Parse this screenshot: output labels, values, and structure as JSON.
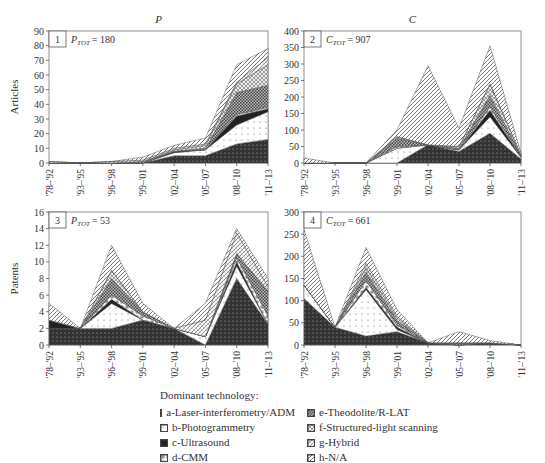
{
  "chart_data": [
    {
      "type": "area",
      "stacked": true,
      "panel_number": "1",
      "title": "P",
      "annotation": "P_TOT = 180",
      "annotation_main": "P",
      "annotation_sub": "TOT",
      "annotation_value": "= 180",
      "xlabel": "",
      "ylabel": "Articles",
      "ylim": [
        0,
        90
      ],
      "yticks": [
        0,
        10,
        20,
        30,
        40,
        50,
        60,
        70,
        80,
        90
      ],
      "categories": [
        "'78–'92",
        "'93–'95",
        "'96–'98",
        "'99–'01",
        "'02–'04",
        "'05–'07",
        "'08–'10",
        "'11–'13"
      ],
      "series": [
        {
          "name": "a-Laser-interferometry/ADM",
          "values": [
            0,
            0,
            0,
            0,
            5,
            5,
            13,
            16
          ]
        },
        {
          "name": "b-Photogrammetry",
          "values": [
            0,
            0,
            0,
            0,
            2,
            4,
            13,
            19
          ]
        },
        {
          "name": "c-Ultrasound",
          "values": [
            0,
            0,
            0,
            0,
            1,
            0,
            6,
            2
          ]
        },
        {
          "name": "d-CMM",
          "values": [
            0,
            0,
            0,
            0,
            0,
            0,
            1,
            1
          ]
        },
        {
          "name": "e-Theodolite/R-LAT",
          "values": [
            0,
            0,
            0,
            1,
            0,
            1,
            15,
            15
          ]
        },
        {
          "name": "f-Structured-light scanning",
          "values": [
            0,
            0,
            0,
            0,
            1,
            2,
            6,
            14
          ]
        },
        {
          "name": "g-Hybrid",
          "values": [
            1,
            0,
            1,
            1,
            1,
            1,
            1,
            5
          ]
        },
        {
          "name": "h-N/A",
          "values": [
            0,
            0,
            0,
            2,
            2,
            4,
            12,
            6
          ]
        }
      ],
      "grid": false
    },
    {
      "type": "area",
      "stacked": true,
      "panel_number": "2",
      "title": "C",
      "annotation": "C_TOT = 907",
      "annotation_main": "C",
      "annotation_sub": "TOT",
      "annotation_value": "= 907",
      "xlabel": "",
      "ylabel": "",
      "ylim": [
        0,
        400
      ],
      "yticks": [
        0,
        50,
        100,
        150,
        200,
        250,
        300,
        350,
        400
      ],
      "categories": [
        "'78–'92",
        "'93–'95",
        "'96–'98",
        "'99–'01",
        "'02–'04",
        "'05–'07",
        "'08–'10",
        "'11–'13"
      ],
      "series": [
        {
          "name": "a-Laser-interferometry/ADM",
          "values": [
            0,
            0,
            0,
            0,
            55,
            35,
            90,
            12
          ]
        },
        {
          "name": "b-Photogrammetry",
          "values": [
            0,
            0,
            0,
            45,
            0,
            5,
            50,
            5
          ]
        },
        {
          "name": "c-Ultrasound",
          "values": [
            0,
            0,
            0,
            0,
            0,
            0,
            20,
            2
          ]
        },
        {
          "name": "d-CMM",
          "values": [
            0,
            0,
            0,
            5,
            0,
            0,
            10,
            1
          ]
        },
        {
          "name": "e-Theodolite/R-LAT",
          "values": [
            0,
            0,
            0,
            25,
            0,
            5,
            35,
            2
          ]
        },
        {
          "name": "f-Structured-light scanning",
          "values": [
            0,
            0,
            0,
            5,
            0,
            5,
            35,
            3
          ]
        },
        {
          "name": "g-Hybrid",
          "values": [
            0,
            0,
            0,
            0,
            0,
            0,
            0,
            0
          ]
        },
        {
          "name": "h-N/A",
          "values": [
            15,
            0,
            0,
            20,
            240,
            55,
            115,
            5
          ]
        }
      ],
      "grid": false
    },
    {
      "type": "area",
      "stacked": true,
      "panel_number": "3",
      "title": "",
      "annotation": "P_TOT = 53",
      "annotation_main": "P",
      "annotation_sub": "TOT",
      "annotation_value": "= 53",
      "xlabel": "",
      "ylabel": "Patents",
      "ylim": [
        0,
        16
      ],
      "yticks": [
        0,
        2,
        4,
        6,
        8,
        10,
        12,
        14,
        16
      ],
      "categories": [
        "'78–'92",
        "'93–'95",
        "'96–'98",
        "'99–'01",
        "'02–'04",
        "'05–'07",
        "'08–'10",
        "'11–'13"
      ],
      "series": [
        {
          "name": "a-Laser-interferometry/ADM",
          "values": [
            2,
            2,
            2,
            3,
            2,
            0,
            8,
            2.5
          ]
        },
        {
          "name": "b-Photogrammetry",
          "values": [
            0,
            0,
            3,
            0,
            0,
            1,
            1.5,
            0
          ]
        },
        {
          "name": "c-Ultrasound",
          "values": [
            1,
            0,
            0.5,
            0,
            0,
            0,
            0.5,
            0
          ]
        },
        {
          "name": "d-CMM",
          "values": [
            0,
            0,
            0.5,
            0.5,
            0,
            0,
            0.5,
            1
          ]
        },
        {
          "name": "e-Theodolite/R-LAT",
          "values": [
            0,
            0,
            2,
            0.5,
            0,
            0,
            0.5,
            3
          ]
        },
        {
          "name": "f-Structured-light scanning",
          "values": [
            0,
            0,
            1,
            0,
            0,
            0,
            0,
            0
          ]
        },
        {
          "name": "g-Hybrid",
          "values": [
            0,
            0,
            0,
            0,
            0,
            2,
            2.5,
            0.5
          ]
        },
        {
          "name": "h-N/A",
          "values": [
            2,
            0,
            3,
            1,
            0,
            2,
            0.5,
            1
          ]
        }
      ],
      "grid": false
    },
    {
      "type": "area",
      "stacked": true,
      "panel_number": "4",
      "title": "",
      "annotation": "C_TOT = 661",
      "annotation_main": "C",
      "annotation_sub": "TOT",
      "annotation_value": "= 661",
      "xlabel": "",
      "ylabel": "",
      "ylim": [
        0,
        300
      ],
      "yticks": [
        0,
        50,
        100,
        150,
        200,
        250,
        300
      ],
      "categories": [
        "'78–'92",
        "'93–'95",
        "'96–'98",
        "'99–'01",
        "'02–'04",
        "'05–'07",
        "'08–'10",
        "'11–'13"
      ],
      "series": [
        {
          "name": "a-Laser-interferometry/ADM",
          "values": [
            105,
            40,
            20,
            30,
            5,
            0,
            5,
            0
          ]
        },
        {
          "name": "b-Photogrammetry",
          "values": [
            30,
            0,
            105,
            5,
            0,
            0,
            0,
            0
          ]
        },
        {
          "name": "c-Ultrasound",
          "values": [
            0,
            0,
            5,
            5,
            0,
            0,
            0,
            0
          ]
        },
        {
          "name": "d-CMM",
          "values": [
            0,
            0,
            15,
            5,
            0,
            0,
            0,
            0
          ]
        },
        {
          "name": "e-Theodolite/R-LAT",
          "values": [
            0,
            0,
            20,
            10,
            0,
            5,
            0,
            0
          ]
        },
        {
          "name": "f-Structured-light scanning",
          "values": [
            0,
            0,
            10,
            5,
            0,
            0,
            0,
            0
          ]
        },
        {
          "name": "g-Hybrid",
          "values": [
            0,
            0,
            10,
            5,
            0,
            0,
            0,
            0
          ]
        },
        {
          "name": "h-N/A",
          "values": [
            125,
            0,
            35,
            15,
            0,
            25,
            5,
            0
          ]
        }
      ],
      "grid": false
    }
  ],
  "legend": {
    "title": "Dominant technology:",
    "position": "bottom",
    "items": [
      {
        "key": "a",
        "label": "a-Laser-interferometry/ADM"
      },
      {
        "key": "b",
        "label": "b-Photogrammetry"
      },
      {
        "key": "c",
        "label": "c-Ultrasound"
      },
      {
        "key": "d",
        "label": "d-CMM"
      },
      {
        "key": "e",
        "label": "e-Theodolite/R-LAT"
      },
      {
        "key": "f",
        "label": "f-Structured-light scanning"
      },
      {
        "key": "g",
        "label": "g-Hybrid"
      },
      {
        "key": "h",
        "label": "h-N/A"
      }
    ]
  },
  "colors": {
    "a": "#3a3a3a",
    "b": "#ffffff",
    "c": "#2a2a2a",
    "d": "#ffffff",
    "e": "#5a5a5a",
    "f": "#9a9a9a",
    "g": "#bbbbbb",
    "h": "#888888",
    "axis": "#555555",
    "text": "#333333"
  }
}
